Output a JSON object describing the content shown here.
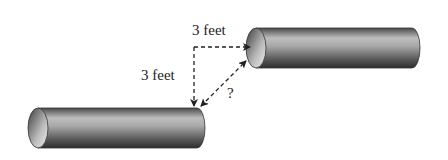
{
  "diagram": {
    "labels": {
      "horizontal_distance": "3 feet",
      "vertical_distance": "3 feet",
      "unknown_distance": "?"
    },
    "objects": {
      "upper_pipe": "cylinder",
      "lower_pipe": "cylinder"
    },
    "colors": {
      "pipe_dark": "#3a3a3a",
      "pipe_light": "#d8d8d8",
      "arrow": "#222222"
    }
  }
}
